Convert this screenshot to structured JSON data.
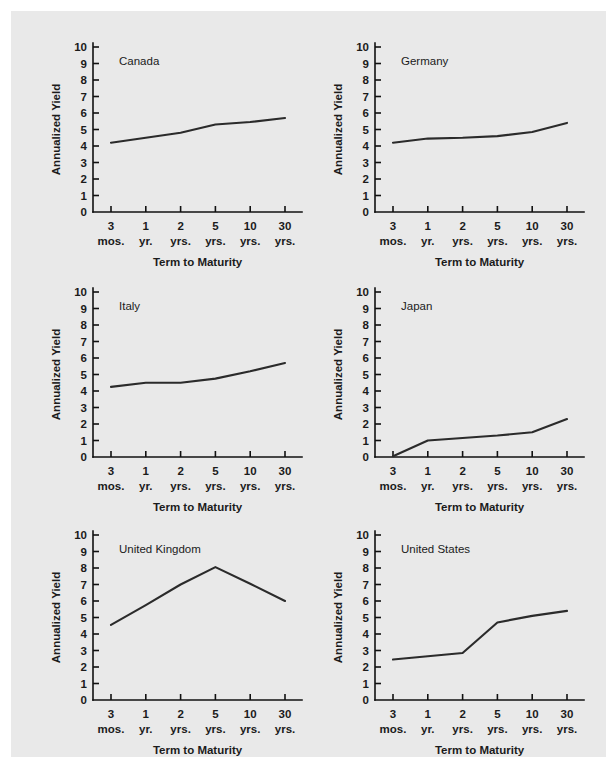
{
  "figure": {
    "background_color": "#ffffff",
    "panel_color": "#e9e9e9",
    "line_color": "#2b2b2b",
    "axis_color": "#111111"
  },
  "chart_data": [
    {
      "type": "line",
      "title": "Canada",
      "xlabel": "Term to Maturity",
      "ylabel": "Annualized Yield",
      "categories": [
        "3 mos.",
        "1 yr.",
        "2 yrs.",
        "5 yrs.",
        "10 yrs.",
        "30 yrs."
      ],
      "tick_top": [
        "3",
        "1",
        "2",
        "5",
        "10",
        "30"
      ],
      "tick_bottom": [
        "mos.",
        "yr.",
        "yrs.",
        "yrs.",
        "yrs.",
        "yrs."
      ],
      "values": [
        4.2,
        4.5,
        4.8,
        5.3,
        5.45,
        5.7
      ],
      "ylim": [
        0,
        10
      ],
      "yticks": [
        0,
        1,
        2,
        3,
        4,
        5,
        6,
        7,
        8,
        9,
        10
      ],
      "grid": false,
      "legend": "none"
    },
    {
      "type": "line",
      "title": "Germany",
      "xlabel": "Term to Maturity",
      "ylabel": "Annualized Yield",
      "categories": [
        "3 mos.",
        "1 yr.",
        "2 yrs.",
        "5 yrs.",
        "10 yrs.",
        "30 yrs."
      ],
      "tick_top": [
        "3",
        "1",
        "2",
        "5",
        "10",
        "30"
      ],
      "tick_bottom": [
        "mos.",
        "yr.",
        "yrs.",
        "yrs.",
        "yrs.",
        "yrs."
      ],
      "values": [
        4.2,
        4.45,
        4.5,
        4.6,
        4.85,
        5.4
      ],
      "ylim": [
        0,
        10
      ],
      "yticks": [
        0,
        1,
        2,
        3,
        4,
        5,
        6,
        7,
        8,
        9,
        10
      ],
      "grid": false,
      "legend": "none"
    },
    {
      "type": "line",
      "title": "Italy",
      "xlabel": "Term to Maturity",
      "ylabel": "Annualized Yield",
      "categories": [
        "3 mos.",
        "1 yr.",
        "2 yrs.",
        "5 yrs.",
        "10 yrs.",
        "30 yrs."
      ],
      "tick_top": [
        "3",
        "1",
        "2",
        "5",
        "10",
        "30"
      ],
      "tick_bottom": [
        "mos.",
        "yr.",
        "yrs.",
        "yrs.",
        "yrs.",
        "yrs."
      ],
      "values": [
        4.25,
        4.5,
        4.5,
        4.75,
        5.2,
        5.7
      ],
      "ylim": [
        0,
        10
      ],
      "yticks": [
        0,
        1,
        2,
        3,
        4,
        5,
        6,
        7,
        8,
        9,
        10
      ],
      "grid": false,
      "legend": "none"
    },
    {
      "type": "line",
      "title": "Japan",
      "xlabel": "Term to Maturity",
      "ylabel": "Annualized Yield",
      "categories": [
        "3 mos.",
        "1 yr.",
        "2 yrs.",
        "5 yrs.",
        "10 yrs.",
        "30 yrs."
      ],
      "tick_top": [
        "3",
        "1",
        "2",
        "5",
        "10",
        "30"
      ],
      "tick_bottom": [
        "mos.",
        "yr.",
        "yrs.",
        "yrs.",
        "yrs.",
        "yrs."
      ],
      "values": [
        0.05,
        1.0,
        1.15,
        1.3,
        1.5,
        2.3
      ],
      "ylim": [
        0,
        10
      ],
      "yticks": [
        0,
        1,
        2,
        3,
        4,
        5,
        6,
        7,
        8,
        9,
        10
      ],
      "grid": false,
      "legend": "none"
    },
    {
      "type": "line",
      "title": "United Kingdom",
      "xlabel": "Term to Maturity",
      "ylabel": "Annualized Yield",
      "categories": [
        "3 mos.",
        "1 yr.",
        "2 yrs.",
        "5 yrs.",
        "10 yrs.",
        "30 yrs."
      ],
      "tick_top": [
        "3",
        "1",
        "2",
        "5",
        "10",
        "30"
      ],
      "tick_bottom": [
        "mos.",
        "yr.",
        "yrs.",
        "yrs.",
        "yrs.",
        "yrs."
      ],
      "values": [
        4.55,
        5.75,
        7.0,
        8.05,
        7.05,
        6.0
      ],
      "ylim": [
        0,
        10
      ],
      "yticks": [
        0,
        1,
        2,
        3,
        4,
        5,
        6,
        7,
        8,
        9,
        10
      ],
      "grid": false,
      "legend": "none"
    },
    {
      "type": "line",
      "title": "United States",
      "xlabel": "Term to Maturity",
      "ylabel": "Annualized Yield",
      "categories": [
        "3 mos.",
        "1 yr.",
        "2 yrs.",
        "5 yrs.",
        "10 yrs.",
        "30 yrs."
      ],
      "tick_top": [
        "3",
        "1",
        "2",
        "5",
        "10",
        "30"
      ],
      "tick_bottom": [
        "mos.",
        "yr.",
        "yrs.",
        "yrs.",
        "yrs.",
        "yrs."
      ],
      "values": [
        2.45,
        2.65,
        2.85,
        4.7,
        5.1,
        5.4
      ],
      "ylim": [
        0,
        10
      ],
      "yticks": [
        0,
        1,
        2,
        3,
        4,
        5,
        6,
        7,
        8,
        9,
        10
      ],
      "grid": false,
      "legend": "none"
    }
  ]
}
